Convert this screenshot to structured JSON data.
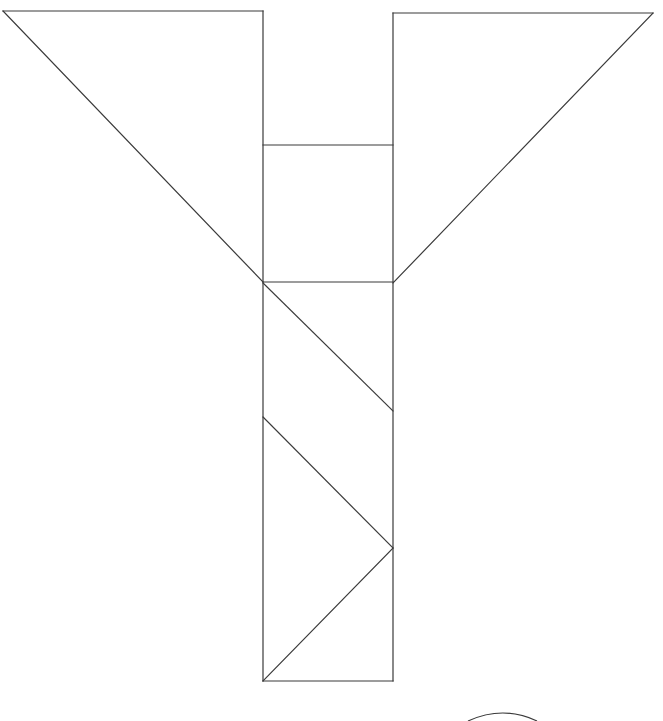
{
  "page": {
    "background_color": "#ffffff",
    "width": 663,
    "height": 721
  },
  "figure": {
    "name": "tangram-style-line-drawing",
    "stroke_color": "#3a3a3a",
    "stroke_width": 1.2,
    "fill": "none",
    "outline_path": "M 3 11 L 263 11 L 263 145 L 263 282 L 263 681 L 393 681 L 393 282 L 393 145 L 393 13 L 653 13 L 393 283 L 393 282 L 263 282 L 3 11 Z",
    "outline_points": "3,11 263,11 263,145 263,282 263,681 393,681 393,282 393,145 393,13 653,13",
    "segments": [
      {
        "name": "top-left-edge",
        "x1": 3,
        "y1": 11,
        "x2": 263,
        "y2": 11
      },
      {
        "name": "left-stem-top-left",
        "x1": 263,
        "y1": 11,
        "x2": 263,
        "y2": 681
      },
      {
        "name": "bottom-edge",
        "x1": 263,
        "y1": 681,
        "x2": 393,
        "y2": 681
      },
      {
        "name": "right-stem",
        "x1": 393,
        "y1": 681,
        "x2": 393,
        "y2": 13
      },
      {
        "name": "top-right-edge",
        "x1": 393,
        "y1": 13,
        "x2": 653,
        "y2": 13
      },
      {
        "name": "right-wing-diagonal",
        "x1": 653,
        "y1": 13,
        "x2": 393,
        "y2": 283
      },
      {
        "name": "left-wing-diagonal",
        "x1": 3,
        "y1": 11,
        "x2": 263,
        "y2": 282
      },
      {
        "name": "upper-crossbar",
        "x1": 263,
        "y1": 145,
        "x2": 393,
        "y2": 145
      },
      {
        "name": "lower-crossbar",
        "x1": 263,
        "y1": 282,
        "x2": 393,
        "y2": 282
      },
      {
        "name": "stem-diagonal-1",
        "x1": 263,
        "y1": 283,
        "x2": 393,
        "y2": 411
      },
      {
        "name": "stem-diagonal-2",
        "x1": 263,
        "y1": 417,
        "x2": 393,
        "y2": 548
      },
      {
        "name": "stem-diagonal-3",
        "x1": 393,
        "y1": 548,
        "x2": 263,
        "y2": 681
      }
    ],
    "arc": {
      "name": "bottom-arc",
      "description": "small arc clipped by the bottom edge of the canvas",
      "path": "M 468 721 Q 503 705 537 721",
      "cx": 503,
      "cy": 721,
      "rx": 35,
      "ry": 16
    }
  }
}
